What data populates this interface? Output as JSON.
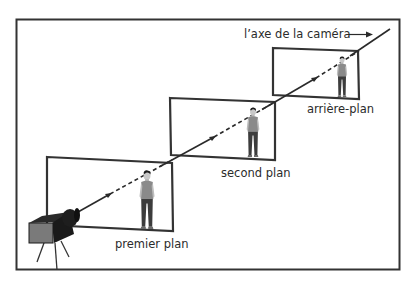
{
  "diagram": {
    "axis_label": "l’axe de la caméra",
    "planes": [
      {
        "id": "foreground",
        "label": "premier plan"
      },
      {
        "id": "middleground",
        "label": "second plan"
      },
      {
        "id": "background",
        "label": "arrière-plan"
      }
    ],
    "colors": {
      "line": "#2a2a2a",
      "frame": "#333333",
      "camera_body": "#1e1e1e",
      "camera_front": "#7a7a7a",
      "shirt": "#8a8a8a",
      "pants": "#3c3c3c",
      "skin": "#c8c8c8",
      "hair": "#1a1a1a"
    }
  }
}
